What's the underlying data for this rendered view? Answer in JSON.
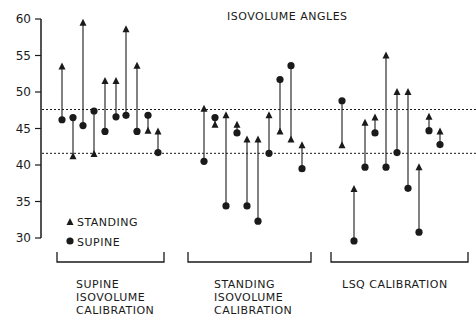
{
  "chart_data": {
    "type": "scatter",
    "title": "ISOVOLUME ANGLES",
    "xlabel": "",
    "ylabel": "",
    "ylim": [
      30,
      60
    ],
    "yticks": [
      30,
      35,
      40,
      45,
      50,
      55,
      60
    ],
    "grid": false,
    "reference_lines": [
      47.6,
      41.6
    ],
    "legend": [
      {
        "marker": "triangle",
        "label": "STANDING"
      },
      {
        "marker": "circle",
        "label": "SUPINE"
      }
    ],
    "legend_position": "lower-left",
    "groups": [
      {
        "label": "SUPINE ISOVOLUME CALIBRATION",
        "label_lines": [
          "SUPINE",
          "ISOVOLUME",
          "CALIBRATION"
        ],
        "pairs": [
          {
            "standing": 53.5,
            "supine": 46.2
          },
          {
            "standing": 41.2,
            "supine": 46.5
          },
          {
            "standing": 59.5,
            "supine": 45.4
          },
          {
            "standing": 41.5,
            "supine": 47.4
          },
          {
            "standing": 51.5,
            "supine": 44.6
          },
          {
            "standing": 51.5,
            "supine": 46.6
          },
          {
            "standing": 58.6,
            "supine": 46.8
          },
          {
            "standing": 53.6,
            "supine": 44.6
          },
          {
            "standing": 44.7,
            "supine": 46.8
          },
          {
            "standing": 44.6,
            "supine": 41.7
          }
        ]
      },
      {
        "label": "STANDING ISOVOLUME CALIBRATION",
        "label_lines": [
          "STANDING",
          "ISOVOLUME",
          "CALIBRATION"
        ],
        "pairs": [
          {
            "standing": 47.7,
            "supine": 40.5
          },
          {
            "standing": 45.5,
            "supine": 46.5
          },
          {
            "standing": 46.8,
            "supine": 34.4
          },
          {
            "standing": 45.5,
            "supine": 44.4
          },
          {
            "standing": 43.5,
            "supine": 34.4
          },
          {
            "standing": 43.5,
            "supine": 32.3
          },
          {
            "standing": 46.8,
            "supine": 41.6
          },
          {
            "standing": 44.6,
            "supine": 51.7
          },
          {
            "standing": 43.5,
            "supine": 53.6
          },
          {
            "standing": 42.7,
            "supine": 39.5
          }
        ]
      },
      {
        "label": "LSQ CALIBRATION",
        "label_lines": [
          "LSQ CALIBRATION"
        ],
        "pairs": [
          {
            "standing": 42.7,
            "supine": 48.8
          },
          {
            "standing": 36.7,
            "supine": 29.6
          },
          {
            "standing": 45.8,
            "supine": 39.7
          },
          {
            "standing": 46.5,
            "supine": 44.4
          },
          {
            "standing": 55.0,
            "supine": 39.7
          },
          {
            "standing": 50.0,
            "supine": 41.7
          },
          {
            "standing": 50.0,
            "supine": 36.8
          },
          {
            "standing": 39.7,
            "supine": 30.8
          },
          {
            "standing": 46.6,
            "supine": 44.7
          },
          {
            "standing": 44.6,
            "supine": 42.8
          }
        ]
      }
    ]
  }
}
